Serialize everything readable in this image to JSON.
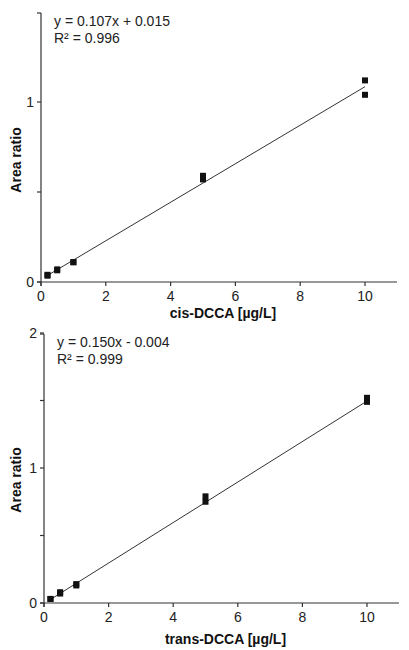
{
  "chart_data": [
    {
      "type": "scatter",
      "title": "",
      "xlabel": "cis-DCCA [µg/L]",
      "ylabel": "Area ratio",
      "xlim": [
        0,
        11
      ],
      "ylim": [
        0,
        1.45
      ],
      "xticks": [
        0,
        2,
        4,
        6,
        8,
        10
      ],
      "yticks": [
        0,
        0.5,
        1
      ],
      "ytick_labels": [
        "0",
        "",
        "1"
      ],
      "grid": false,
      "legend": "none",
      "annotation": {
        "equation": "y = 0.107x + 0.015",
        "r2": "R² = 0.996"
      },
      "fit": {
        "slope": 0.107,
        "intercept": 0.015,
        "x_range": [
          0.2,
          10
        ]
      },
      "series": [
        {
          "name": "cis-DCCA calibration",
          "x": [
            0.2,
            0.2,
            0.5,
            0.5,
            1,
            1,
            5,
            5,
            10,
            10
          ],
          "y": [
            0.035,
            0.04,
            0.065,
            0.07,
            0.11,
            0.11,
            0.57,
            0.59,
            1.04,
            1.12
          ]
        }
      ]
    },
    {
      "type": "scatter",
      "title": "",
      "xlabel": "trans-DCCA [µg/L]",
      "ylabel": "Area ratio",
      "xlim": [
        0,
        11
      ],
      "ylim": [
        0,
        2
      ],
      "xticks": [
        0,
        2,
        4,
        6,
        8,
        10
      ],
      "yticks": [
        0,
        0.5,
        1,
        1.5,
        2
      ],
      "ytick_labels": [
        "0",
        "",
        "1",
        "",
        "2"
      ],
      "grid": false,
      "legend": "none",
      "annotation": {
        "equation": "y = 0.150x - 0.004",
        "r2": "R² = 0.999"
      },
      "fit": {
        "slope": 0.15,
        "intercept": -0.004,
        "x_range": [
          0.2,
          10
        ]
      },
      "series": [
        {
          "name": "trans-DCCA calibration",
          "x": [
            0.2,
            0.2,
            0.5,
            0.5,
            1,
            1,
            5,
            5,
            10,
            10
          ],
          "y": [
            0.03,
            0.03,
            0.07,
            0.08,
            0.13,
            0.14,
            0.75,
            0.79,
            1.49,
            1.52
          ]
        }
      ]
    }
  ]
}
